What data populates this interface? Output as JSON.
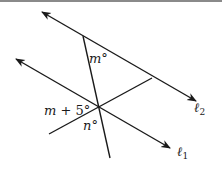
{
  "figure": {
    "colors": {
      "line": "#1a1a1a",
      "border": "#8a8a8a",
      "background": "#ffffff"
    },
    "lines": [
      {
        "name": "l2",
        "x1": 42,
        "y1": 12,
        "x2": 196,
        "y2": 101,
        "arrows": "both"
      },
      {
        "name": "l1",
        "x1": 16,
        "y1": 59,
        "x2": 170,
        "y2": 148,
        "arrows": "both"
      },
      {
        "name": "transversal",
        "x1": 83,
        "y1": 36,
        "x2": 110,
        "y2": 158,
        "arrows": "none"
      },
      {
        "name": "connector",
        "x1": 49,
        "y1": 134,
        "x2": 152,
        "y2": 78,
        "arrows": "none"
      }
    ],
    "labels": {
      "angle_m": {
        "var": "m",
        "suffix": "°"
      },
      "angle_m_plus_5": {
        "var": "m",
        "rest": " + 5°"
      },
      "angle_n": {
        "var": "n",
        "suffix": "°"
      },
      "line_l2": {
        "var": "ℓ",
        "sub": "2"
      },
      "line_l1": {
        "var": "ℓ",
        "sub": "1"
      }
    }
  }
}
